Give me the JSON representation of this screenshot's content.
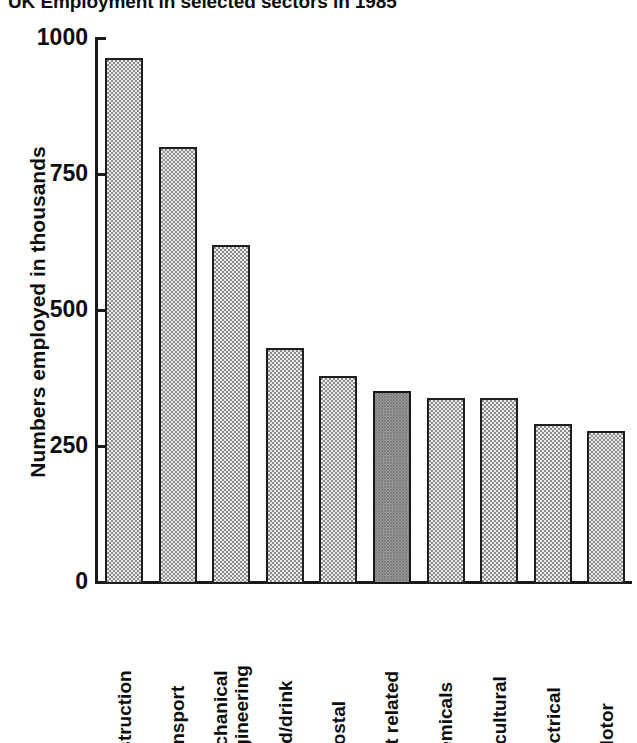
{
  "chart_data": {
    "type": "bar",
    "title": "UK Employment in selected sectors in 1985",
    "xlabel": "",
    "ylabel": "Numbers employed in thousands",
    "ylim": [
      0,
      1000
    ],
    "yticks": [
      0,
      250,
      500,
      750,
      1000
    ],
    "ytick_labels": [
      "0",
      "250",
      "500",
      "750",
      "1000"
    ],
    "grid": false,
    "legend": false,
    "highlight_category": "Sport related",
    "highlight_color": "#9a9a9a",
    "bar_color": "#e9e9e9",
    "bar_edge_color": "#1f1f1f",
    "categories": [
      "Construction",
      "Transport",
      "Mechanical engineering",
      "Food/drink",
      "Postal",
      "Sport related",
      "Chemicals",
      "Agricultural",
      "Electrical",
      "Motor"
    ],
    "category_lines": [
      [
        "Construction"
      ],
      [
        "Transport"
      ],
      [
        "Mechanical",
        "engineering"
      ],
      [
        "Food/drink"
      ],
      [
        "Postal"
      ],
      [
        "Sport related"
      ],
      [
        "Chemicals"
      ],
      [
        "Agricultural"
      ],
      [
        "Electrical"
      ],
      [
        "Motor"
      ]
    ],
    "values": [
      963,
      800,
      620,
      430,
      378,
      352,
      338,
      338,
      290,
      277
    ]
  }
}
